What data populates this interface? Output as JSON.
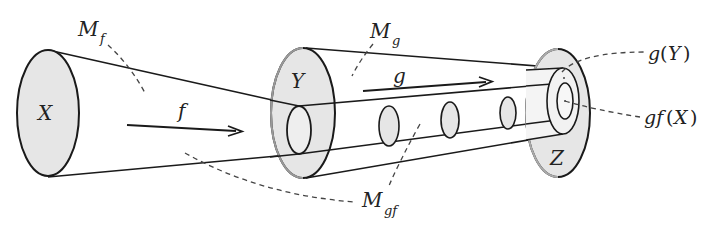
{
  "diagram": {
    "colors": {
      "stroke": "#1a1a1a",
      "fill": "#e6e6e6",
      "leader": "#444444"
    },
    "spaces": {
      "X": "X",
      "Y": "Y",
      "Z": "Z"
    },
    "maps": {
      "f": "f",
      "g": "g"
    },
    "cylinders": {
      "Mf": {
        "base": "M",
        "sub": "f"
      },
      "Mg": {
        "base": "M",
        "sub": "g"
      },
      "Mgf": {
        "base": "M",
        "sub": "gf"
      }
    },
    "images": {
      "gY": {
        "fn": "g",
        "open": "(",
        "arg": "Y",
        "close": ")"
      },
      "gfX": {
        "fn": "gf",
        "open": "(",
        "arg": "X",
        "close": ")"
      }
    }
  }
}
